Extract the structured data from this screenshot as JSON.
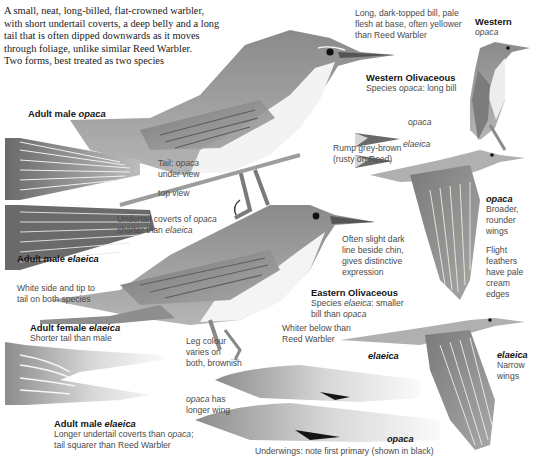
{
  "intro": {
    "lines": [
      "A small, neat, long-billed, flat-crowned warbler,",
      "with short undertail coverts, a deep belly and a long",
      "tail that is often dipped downwards as it moves",
      "through foliage, unlike similar Reed Warbler.",
      "Two forms, best treated as two species"
    ]
  },
  "bill_note": {
    "lines": [
      "Long, dark-topped bill, pale",
      "flesh at base, often yellower",
      "than Reed Warbler"
    ]
  },
  "western": {
    "title": "Western",
    "subtitle": "opaca"
  },
  "western_olivaceous": {
    "title": "Western Olivaceous",
    "species_prefix": "Species ",
    "species_name": "opaca",
    "species_suffix": ": long bill"
  },
  "bill_labels": {
    "top": "opaca",
    "bottom": "elaeica"
  },
  "rump_note": {
    "lines": [
      "Rump grey-brown",
      "(rusty on Reed)"
    ]
  },
  "adult_male_opaca": {
    "prefix": "Adult male ",
    "name": "opaca"
  },
  "tail_under": {
    "prefix": "Tail: ",
    "name": "opaca",
    "line2": "under view"
  },
  "tail_top": {
    "label": "top view"
  },
  "undertail_note": {
    "line1_prefix": "Undertail coverts of ",
    "line1_name": "opaca",
    "line2_prefix": "shorter than ",
    "line2_name": "elaeica"
  },
  "opaca_wing": {
    "title": "opaca",
    "lines": [
      "Broader,",
      "rounder",
      "wings"
    ],
    "flight_lines": [
      "Flight",
      "feathers",
      "have pale",
      "cream",
      "edges"
    ]
  },
  "chin_note": {
    "lines": [
      "Often slight dark",
      "line beside chin,",
      "gives distinctive",
      "expression"
    ]
  },
  "adult_male_elaeica_top": {
    "prefix": "Adult male ",
    "name": "elaeica"
  },
  "white_side_note": {
    "lines": [
      "White side and tip to",
      "tail on both species"
    ]
  },
  "eastern_olivaceous": {
    "title": "Eastern Olivaceous",
    "species_prefix": "Species ",
    "species_name": "elaeica",
    "species_suffix": ": smaller",
    "line2_prefix": "bill than ",
    "line2_name": "opaca"
  },
  "adult_female_elaeica": {
    "prefix": "Adult female ",
    "name": "elaeica",
    "note": "Shorter tail than male"
  },
  "whiter_note": {
    "lines": [
      "Whiter below than",
      "Reed Warbler"
    ]
  },
  "leg_note": {
    "lines": [
      "Leg colour",
      "varies on",
      "both, brownish"
    ]
  },
  "elaeica_underwing_label": "elaeica",
  "elaeica_wing": {
    "title": "elaeica",
    "lines": [
      "Narrow",
      "wings"
    ]
  },
  "opaca_longer": {
    "name": "opaca",
    "suffix": " has",
    "line2": "longer wing"
  },
  "adult_male_elaeica_bottom": {
    "prefix": "Adult male ",
    "name": "elaeica",
    "line1_prefix": "Longer undertail coverts than ",
    "line1_name": "opaca",
    "line1_suffix": ";",
    "line2": "tail squarer than Reed Warbler"
  },
  "opaca_underwing_label": "opaca",
  "underwings_note": "Underwings: note first primary (shown in black)",
  "colors": {
    "plumage_dark": "#6e6e6e",
    "plumage_mid": "#9a9a9a",
    "plumage_light": "#cfcfcf",
    "belly": "#f2f2f2",
    "text": "#3a3a3a"
  }
}
